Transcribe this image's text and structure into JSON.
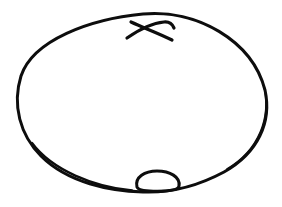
{
  "figure": {
    "title": "",
    "background_color": "#ffffff",
    "stroke_color": "#0d0d0d",
    "shapes": [
      {
        "name": "outer-ellipse",
        "type": "ellipse-outline",
        "role": "main enclosing shape"
      },
      {
        "name": "x-mark",
        "type": "cross",
        "role": "marker near top inside edge"
      },
      {
        "name": "small-loop",
        "type": "ellipse-outline",
        "role": "small bump on bottom edge"
      }
    ]
  }
}
